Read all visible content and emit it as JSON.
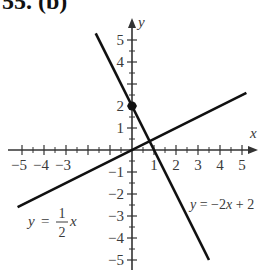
{
  "header": {
    "title": "55. (b)"
  },
  "chart_data": {
    "type": "line",
    "title": "55. (b)",
    "xlabel": "x",
    "ylabel": "y",
    "xlim": [
      -5.5,
      5.5
    ],
    "ylim": [
      -5.3,
      5.6
    ],
    "grid": false,
    "x_ticks": [
      -5,
      -4,
      -3,
      -2,
      -1,
      0,
      1,
      2,
      3,
      4,
      5
    ],
    "x_tick_labels": [
      "-5",
      "-4",
      "-3",
      "1",
      "2",
      "3",
      "4",
      "5"
    ],
    "y_ticks": [
      -5,
      -4,
      -3,
      -2,
      -1,
      0,
      1,
      2,
      3,
      4,
      5
    ],
    "y_tick_labels": [
      "5",
      "4",
      "2",
      "1",
      "-1",
      "-2",
      "-3",
      "-4",
      "-5"
    ],
    "minor_ticks_per_unit": 2,
    "series": [
      {
        "name": "y = -2x + 2",
        "equation": "y = -2x + 2",
        "slope": -2,
        "intercept": 2,
        "x": [
          -1.65,
          3.5
        ],
        "y": [
          5.3,
          -5.0
        ]
      },
      {
        "name": "y = 1/2 x",
        "equation": "y = (1/2)x",
        "slope": 0.5,
        "intercept": 0,
        "x": [
          -5.2,
          5.2
        ],
        "y": [
          -2.6,
          2.6
        ]
      }
    ],
    "points": [
      {
        "x": 0,
        "y": 2,
        "label": "y-intercept",
        "style": "filled-circle"
      }
    ],
    "annotations": [
      {
        "text": "y = 1/2 x",
        "near": [
          -4.5,
          -4.0
        ]
      },
      {
        "text": "y = -2x + 2",
        "near": [
          3.3,
          -2.9
        ]
      }
    ],
    "colors": {
      "lines": "#111111",
      "axes": "#333333",
      "text": "#3a3a3a"
    }
  }
}
